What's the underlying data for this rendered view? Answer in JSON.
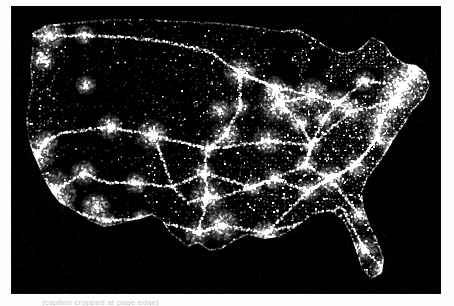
{
  "image": {
    "kind": "satellite-nighttime-lights-photograph",
    "subject": "United States at night, city lights from space",
    "background_color": "#ffffff",
    "plate_color": "#000000",
    "light_color": "#ffffff",
    "caption_text": "(caption cropped at page edge)",
    "plate": {
      "left": 12,
      "top": 7,
      "width": 428,
      "height": 286
    }
  },
  "regions": [
    {
      "name": "pacific-northwest",
      "label": "Seattle / Portland corridor"
    },
    {
      "name": "california-coast",
      "label": "San Francisco Bay and Los Angeles basin"
    },
    {
      "name": "southwest-desert",
      "label": "Sparse desert interior"
    },
    {
      "name": "front-range",
      "label": "Denver / Front Range"
    },
    {
      "name": "great-plains-grid",
      "label": "Section-road grid of the Plains"
    },
    {
      "name": "texas-triangle",
      "label": "Dallas, Houston, San Antonio"
    },
    {
      "name": "great-lakes",
      "label": "Chicago, Detroit, Cleveland around dark lakes"
    },
    {
      "name": "northeast-corridor",
      "label": "Boston to Washington megalopolis"
    },
    {
      "name": "southeast",
      "label": "Atlanta and Gulf Coast"
    },
    {
      "name": "florida-peninsula",
      "label": "Florida coastal outline"
    }
  ],
  "chart_data": {
    "type": "heatmap",
    "xlabel": "",
    "ylabel": "",
    "grid": false,
    "legend": "none",
    "xlim": [
      0,
      428
    ],
    "ylim": [
      0,
      286
    ],
    "series": [
      {
        "name": "major-metro-cores",
        "units": "relative radiance",
        "points": [
          {
            "city": "New York",
            "x": 392,
            "y": 78,
            "value": 100,
            "radius": 16
          },
          {
            "city": "Chicago",
            "x": 268,
            "y": 96,
            "value": 96,
            "radius": 15
          },
          {
            "city": "Los Angeles",
            "x": 42,
            "y": 184,
            "value": 95,
            "radius": 15
          },
          {
            "city": "Philadelphia",
            "x": 381,
            "y": 95,
            "value": 82,
            "radius": 12
          },
          {
            "city": "Detroit",
            "x": 300,
            "y": 88,
            "value": 80,
            "radius": 12
          },
          {
            "city": "Washington DC",
            "x": 368,
            "y": 112,
            "value": 80,
            "radius": 12
          },
          {
            "city": "Boston",
            "x": 404,
            "y": 62,
            "value": 78,
            "radius": 11
          },
          {
            "city": "Dallas",
            "x": 196,
            "y": 190,
            "value": 80,
            "radius": 12
          },
          {
            "city": "Houston",
            "x": 210,
            "y": 218,
            "value": 78,
            "radius": 12
          },
          {
            "city": "Atlanta",
            "x": 318,
            "y": 172,
            "value": 76,
            "radius": 11
          },
          {
            "city": "Miami",
            "x": 372,
            "y": 262,
            "value": 72,
            "radius": 10
          },
          {
            "city": "San Francisco",
            "x": 24,
            "y": 148,
            "value": 80,
            "radius": 12
          },
          {
            "city": "Seattle",
            "x": 38,
            "y": 28,
            "value": 74,
            "radius": 11
          },
          {
            "city": "Denver",
            "x": 140,
            "y": 128,
            "value": 76,
            "radius": 11
          },
          {
            "city": "Phoenix",
            "x": 84,
            "y": 200,
            "value": 72,
            "radius": 10
          },
          {
            "city": "Minneapolis",
            "x": 228,
            "y": 66,
            "value": 74,
            "radius": 11
          },
          {
            "city": "St. Louis",
            "x": 256,
            "y": 134,
            "value": 72,
            "radius": 10
          },
          {
            "city": "Kansas City",
            "x": 214,
            "y": 128,
            "value": 70,
            "radius": 10
          },
          {
            "city": "Cleveland",
            "x": 326,
            "y": 96,
            "value": 72,
            "radius": 10
          },
          {
            "city": "Pittsburgh",
            "x": 340,
            "y": 104,
            "value": 68,
            "radius": 9
          },
          {
            "city": "Charlotte",
            "x": 344,
            "y": 158,
            "value": 66,
            "radius": 9
          },
          {
            "city": "Tampa",
            "x": 352,
            "y": 242,
            "value": 68,
            "radius": 9
          },
          {
            "city": "New Orleans",
            "x": 254,
            "y": 226,
            "value": 68,
            "radius": 9
          },
          {
            "city": "Salt Lake City",
            "x": 98,
            "y": 120,
            "value": 64,
            "radius": 9
          },
          {
            "city": "Las Vegas",
            "x": 72,
            "y": 166,
            "value": 64,
            "radius": 9
          },
          {
            "city": "San Diego",
            "x": 50,
            "y": 202,
            "value": 66,
            "radius": 9
          },
          {
            "city": "Portland",
            "x": 30,
            "y": 52,
            "value": 64,
            "radius": 9
          },
          {
            "city": "Memphis",
            "x": 262,
            "y": 172,
            "value": 62,
            "radius": 8
          },
          {
            "city": "Oklahoma City",
            "x": 192,
            "y": 166,
            "value": 62,
            "radius": 8
          },
          {
            "city": "Indianapolis",
            "x": 288,
            "y": 116,
            "value": 62,
            "radius": 8
          },
          {
            "city": "Nashville",
            "x": 294,
            "y": 158,
            "value": 60,
            "radius": 8
          },
          {
            "city": "Milwaukee",
            "x": 262,
            "y": 80,
            "value": 60,
            "radius": 8
          },
          {
            "city": "San Antonio",
            "x": 186,
            "y": 226,
            "value": 64,
            "radius": 9
          },
          {
            "city": "Albuquerque",
            "x": 124,
            "y": 176,
            "value": 56,
            "radius": 8
          },
          {
            "city": "Omaha",
            "x": 208,
            "y": 104,
            "value": 58,
            "radius": 8
          },
          {
            "city": "Jacksonville",
            "x": 348,
            "y": 208,
            "value": 58,
            "radius": 8
          },
          {
            "city": "Birmingham",
            "x": 296,
            "y": 184,
            "value": 56,
            "radius": 8
          },
          {
            "city": "Richmond",
            "x": 366,
            "y": 130,
            "value": 56,
            "radius": 8
          },
          {
            "city": "Buffalo",
            "x": 352,
            "y": 74,
            "value": 56,
            "radius": 8
          },
          {
            "city": "El Paso",
            "x": 130,
            "y": 212,
            "value": 54,
            "radius": 7
          },
          {
            "city": "Boise",
            "x": 74,
            "y": 78,
            "value": 50,
            "radius": 7
          },
          {
            "city": "Spokane",
            "x": 72,
            "y": 28,
            "value": 50,
            "radius": 7
          },
          {
            "city": "Louisville",
            "x": 300,
            "y": 138,
            "value": 54,
            "radius": 7
          },
          {
            "city": "Columbus",
            "x": 312,
            "y": 112,
            "value": 56,
            "radius": 8
          },
          {
            "city": "Little Rock",
            "x": 240,
            "y": 180,
            "value": 52,
            "radius": 7
          },
          {
            "city": "Des Moines",
            "x": 228,
            "y": 100,
            "value": 52,
            "radius": 7
          },
          {
            "city": "Wichita",
            "x": 196,
            "y": 142,
            "value": 52,
            "radius": 7
          },
          {
            "city": "Tucson",
            "x": 94,
            "y": 214,
            "value": 50,
            "radius": 7
          },
          {
            "city": "Sacramento",
            "x": 34,
            "y": 134,
            "value": 56,
            "radius": 8
          },
          {
            "city": "Norfolk",
            "x": 378,
            "y": 138,
            "value": 56,
            "radius": 8
          }
        ]
      },
      {
        "name": "dark-water-voids",
        "units": "near-zero radiance",
        "points": [
          {
            "feature": "Lake Michigan",
            "x": 272,
            "y": 70,
            "value": 2
          },
          {
            "feature": "Lake Superior",
            "x": 268,
            "y": 36,
            "value": 1
          },
          {
            "feature": "Lake Huron",
            "x": 306,
            "y": 58,
            "value": 2
          },
          {
            "feature": "Lake Erie",
            "x": 330,
            "y": 84,
            "value": 2
          },
          {
            "feature": "Lake Ontario",
            "x": 356,
            "y": 66,
            "value": 2
          },
          {
            "feature": "Atlantic Ocean",
            "x": 412,
            "y": 200,
            "value": 0
          },
          {
            "feature": "Gulf of Mexico",
            "x": 290,
            "y": 256,
            "value": 0
          },
          {
            "feature": "Pacific Ocean",
            "x": 10,
            "y": 230,
            "value": 0
          }
        ]
      }
    ]
  }
}
